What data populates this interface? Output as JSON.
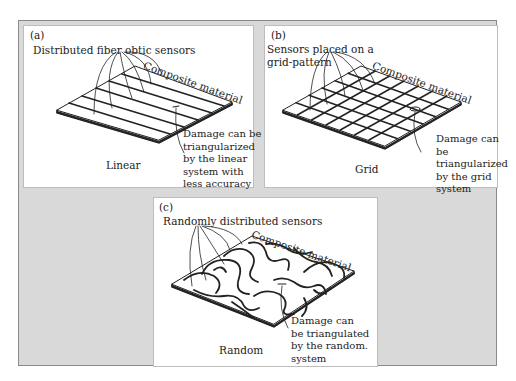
{
  "figure": {
    "panels": [
      {
        "id": "a",
        "label": "(a)",
        "sensor_label": "Distributed fiber obtic sensors",
        "material_label": "Composite material",
        "damage_note": "Damage can be\ntriangularized\nby the linear\nsystem with\nless accuracy",
        "caption": "Linear",
        "layout": "linear"
      },
      {
        "id": "b",
        "label": "(b)",
        "sensor_label": "Sensors placed on a\ngrid-pattern",
        "material_label": "Composite material",
        "damage_note": "Damage can\nbe\ntriangularized\nby the grid\nsystem",
        "caption": "Grid",
        "layout": "grid"
      },
      {
        "id": "c",
        "label": "(c)",
        "sensor_label": "Randomly distributed sensors",
        "material_label": "Composite material",
        "damage_note": "Damage can\nbe triangulated\nby the random.\nsystem",
        "caption": "Random",
        "layout": "random"
      }
    ],
    "colors": {
      "background": "#d9d9d9",
      "panel": "#ffffff",
      "ink": "#222222"
    }
  }
}
